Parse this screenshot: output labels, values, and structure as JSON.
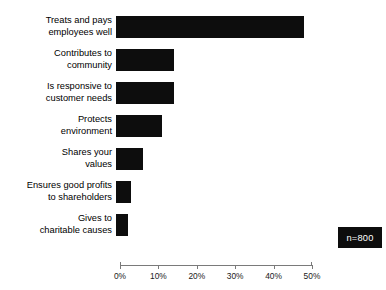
{
  "chart_data": {
    "type": "bar",
    "orientation": "horizontal",
    "title": "",
    "subtitle": "",
    "xlabel": "",
    "ylabel": "",
    "categories": [
      "Treats and pays\nemployees well",
      "Contributes to\ncommunity",
      "Is responsive to\ncustomer needs",
      "Protects\nenvironment",
      "Shares your\nvalues",
      "Ensures good profits\nto shareholders",
      "Gives to\ncharitable causes"
    ],
    "values": [
      49,
      15,
      15,
      12,
      7,
      4,
      3
    ],
    "value_unit": "%",
    "xlim": [
      0,
      50
    ],
    "xticks": [
      0,
      10,
      20,
      30,
      40,
      50
    ],
    "xtick_labels": [
      "0%",
      "10%",
      "20%",
      "30%",
      "40%",
      "50%"
    ],
    "grid": false,
    "legend": "none",
    "bar_color": "#0d0d0d",
    "axis_color": "#7a7a7a"
  },
  "annotations": {
    "sample_size_label": "n=800"
  },
  "title_remnant": ""
}
